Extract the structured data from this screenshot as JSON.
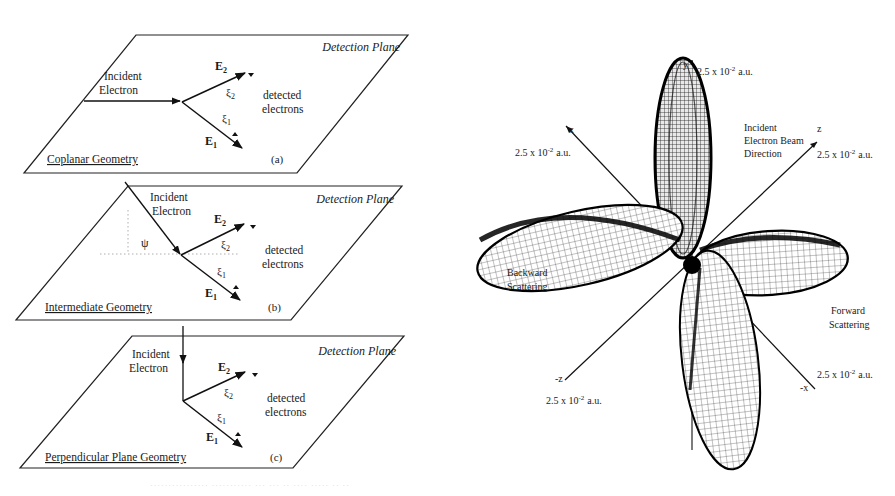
{
  "figure": {
    "left_panels": [
      {
        "id": "a",
        "plane_label": "Detection Plane",
        "incident_label_line1": "Incident",
        "incident_label_line2": "Electron",
        "e2_label": "E",
        "e2_sub": "2",
        "e1_label": "E",
        "e1_sub": "1",
        "xi2_label": "ξ",
        "xi2_sub": "2",
        "xi1_label": "ξ",
        "xi1_sub": "1",
        "detected_line1": "detected",
        "detected_line2": "electrons",
        "geometry_label": "Coplanar Geometry",
        "panel_tag": "(a)"
      },
      {
        "id": "b",
        "plane_label": "Detection Plane",
        "incident_label_line1": "Incident",
        "incident_label_line2": "Electron",
        "psi_label": "ψ",
        "e2_label": "E",
        "e2_sub": "2",
        "e1_label": "E",
        "e1_sub": "1",
        "xi2_label": "ξ",
        "xi2_sub": "2",
        "xi1_label": "ξ",
        "xi1_sub": "1",
        "detected_line1": "detected",
        "detected_line2": "electrons",
        "geometry_label": "Intermediate Geometry",
        "panel_tag": "(b)"
      },
      {
        "id": "c",
        "plane_label": "Detection Plane",
        "incident_label_line1": "Incident",
        "incident_label_line2": "Electron",
        "e2_label": "E",
        "e2_sub": "2",
        "e1_label": "E",
        "e1_sub": "1",
        "xi2_label": "ξ",
        "xi2_sub": "2",
        "xi1_label": "ξ",
        "xi1_sub": "1",
        "detected_line1": "detected",
        "detected_line2": "electrons",
        "geometry_label": "Perpendicular Plane Geometry",
        "panel_tag": "(c)"
      }
    ],
    "right_plot": {
      "axes": {
        "y": "y",
        "x": "x",
        "z": "z",
        "neg_z": "-z",
        "neg_x": "-x"
      },
      "scale_label": "2.5 x 10",
      "scale_exp": "-2",
      "scale_unit": "a.u.",
      "beam_label_line1": "Incident",
      "beam_label_line2": "Electron Beam",
      "beam_label_line3": "Direction",
      "backward_line1": "Backward",
      "backward_line2": "Scattering",
      "forward_line1": "Forward",
      "forward_line2": "Scattering"
    },
    "caption": "················ ··········· ··· ··· ·· ···· ····· ·· ··"
  }
}
